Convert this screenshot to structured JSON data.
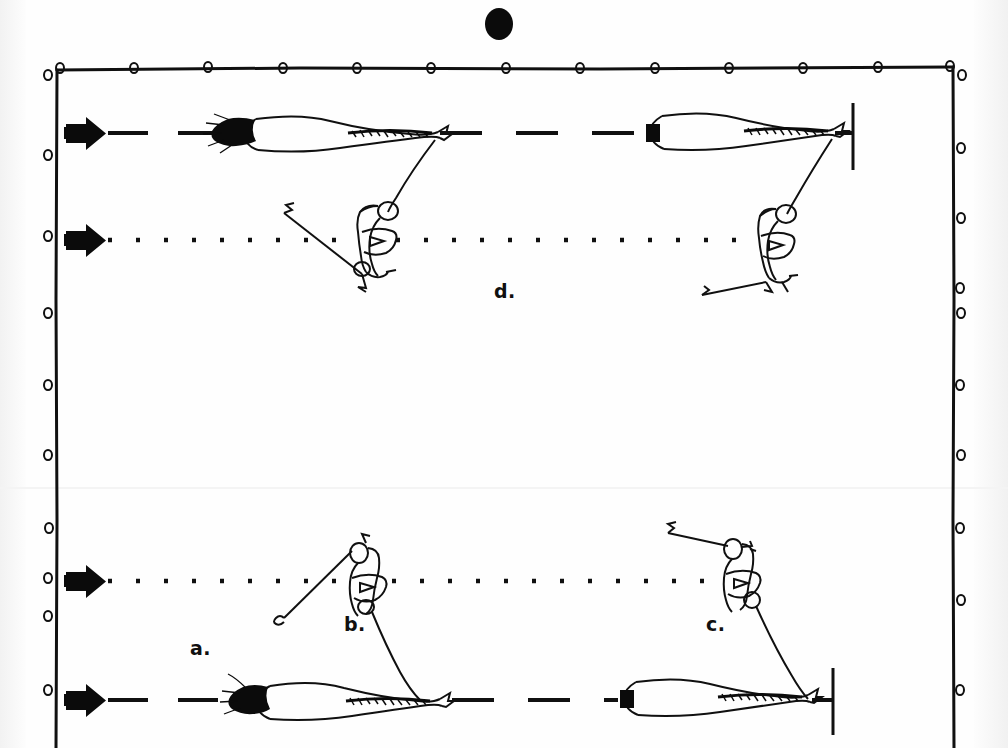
{
  "figure": {
    "kind": "hand-drawn-scanned-diagram",
    "title": "",
    "background_color": "#fefefe",
    "ink_color": "#101010",
    "page_width": 1008,
    "page_height": 748
  },
  "top_marker": {
    "name": "solid-black-dot",
    "shape": "filled-ellipse",
    "color": "#0b0b0b",
    "x": 499,
    "y": 24,
    "rx": 14,
    "ry": 16
  },
  "frame": {
    "name": "hand-drawn-rectangular-border",
    "color": "#101010",
    "left": 56,
    "top": 68,
    "right": 955,
    "bottom": 748,
    "stroke_width": 3,
    "tick_circles": {
      "name": "small-open-circles-on-frame",
      "radius": 4,
      "top_count": 13,
      "left_count": 10,
      "right_count": 10,
      "fill": "none"
    }
  },
  "tracks": [
    {
      "id": "track-1",
      "label": "upper-dashed-track",
      "style": "dashed",
      "y": 133,
      "x_start": 108,
      "x_end": 852,
      "arrow_marker": {
        "name": "direction-arrow",
        "x": 68,
        "y": 133,
        "direction": "right"
      },
      "end_bar": {
        "name": "vertical-end-bar",
        "x": 852,
        "y_top": 103,
        "y_bottom": 170
      }
    },
    {
      "id": "track-2",
      "label": "upper-dotted-track",
      "style": "dotted",
      "y": 240,
      "x_start": 108,
      "x_end": 790,
      "arrow_marker": {
        "name": "direction-arrow",
        "x": 68,
        "y": 240,
        "direction": "right"
      },
      "end_bar": null
    },
    {
      "id": "track-3",
      "label": "lower-dotted-track",
      "style": "dotted",
      "y": 581,
      "x_start": 108,
      "x_end": 770,
      "arrow_marker": {
        "name": "direction-arrow",
        "x": 68,
        "y": 581,
        "direction": "right"
      },
      "end_bar": null
    },
    {
      "id": "track-4",
      "label": "lower-dashed-track",
      "style": "dashed",
      "y": 700,
      "x_start": 108,
      "x_end": 832,
      "arrow_marker": {
        "name": "direction-arrow",
        "x": 68,
        "y": 700,
        "direction": "right"
      },
      "end_bar": {
        "name": "vertical-end-bar",
        "x": 832,
        "y_top": 668,
        "y_bottom": 735
      }
    }
  ],
  "panel_labels": [
    {
      "id": "a",
      "text": "a.",
      "x": 190,
      "y": 637
    },
    {
      "id": "b",
      "text": "b.",
      "x": 344,
      "y": 613
    },
    {
      "id": "c",
      "text": "c.",
      "x": 706,
      "y": 613
    },
    {
      "id": "d",
      "text": "d.",
      "x": 494,
      "y": 280
    }
  ],
  "drawn_objects": [
    {
      "id": "creature-upper-left",
      "name": "teardrop-body-with-plume",
      "on_track": "track-1",
      "x": 218,
      "y": 133,
      "description": "elongated teardrop body with dark bristled plume at left end and hatched tapering tail to the right"
    },
    {
      "id": "creature-upper-right",
      "name": "teardrop-body-with-plume",
      "on_track": "track-1",
      "x": 645,
      "y": 133,
      "description": "elongated teardrop body with dark node at left end and hatched tapering tail to the right"
    },
    {
      "id": "rider-upper-left",
      "name": "triangle-badge-figure",
      "on_track": "track-2",
      "x": 372,
      "y": 240,
      "description": "small stick mechanism with open circles and a triangle-in-outline badge, tethered by a curved line to creature-upper-left tail; diagonal pole trails down-left"
    },
    {
      "id": "rider-upper-right",
      "name": "triangle-badge-figure",
      "on_track": "track-2",
      "x": 775,
      "y": 243,
      "description": "small stick mechanism with open circles and a triangle-in-outline badge, tethered by a curved line to creature-upper-right tail; pole trails down-left"
    },
    {
      "id": "rider-lower-left",
      "name": "triangle-badge-figure",
      "on_track": "track-3",
      "x": 372,
      "y": 581,
      "description": "stick mechanism with triangle badge; line runs up-left as a pole and down-right tether to creature-lower-left"
    },
    {
      "id": "rider-lower-right",
      "name": "triangle-badge-figure",
      "on_track": "track-3",
      "x": 740,
      "y": 578,
      "description": "stick mechanism with triangle badge; pole extends up-left, tether curves down to creature-lower-right"
    },
    {
      "id": "creature-lower-left",
      "name": "teardrop-body-with-plume",
      "on_track": "track-4",
      "x": 232,
      "y": 700,
      "description": "elongated teardrop body with dark bristled plume at left and hatched tail to the right"
    },
    {
      "id": "creature-lower-right",
      "name": "teardrop-body-with-plume",
      "on_track": "track-4",
      "x": 620,
      "y": 700,
      "description": "elongated teardrop body with dark node at left and hatched tail to the right"
    }
  ]
}
